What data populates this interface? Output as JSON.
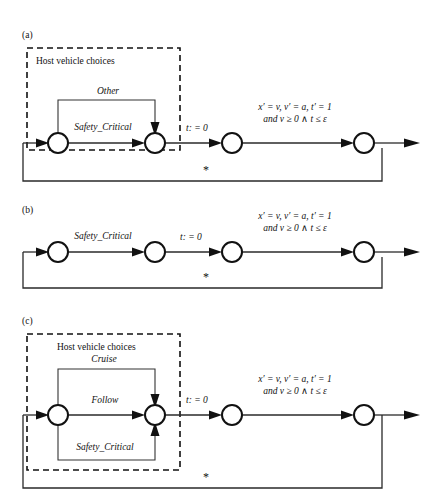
{
  "figure": {
    "type": "diagram",
    "panels": [
      {
        "id": "a",
        "label": "(a)",
        "box": {
          "present": true,
          "title": "Host vehicle choices",
          "style": "dashed"
        },
        "choice_transitions": [
          {
            "name": "Other",
            "route": "top-arc"
          },
          {
            "name": "Safety_Critical",
            "route": "straight"
          }
        ],
        "reset_label": "t: = 0",
        "flow_line1": "x′ = v, v′ = a, t′ = 1",
        "flow_line2": "and v ≥ 0 ∧ t ≤ ε",
        "loop_label": "*",
        "node_count": 4
      },
      {
        "id": "b",
        "label": "(b)",
        "box": {
          "present": false,
          "title": "",
          "style": "none"
        },
        "choice_transitions": [
          {
            "name": "Safety_Critical",
            "route": "straight"
          }
        ],
        "reset_label": "t: = 0",
        "flow_line1": "x′ = v, v′ = a, t′ = 1",
        "flow_line2": "and v ≥ 0 ∧ t ≤ ε",
        "loop_label": "*",
        "node_count": 4
      },
      {
        "id": "c",
        "label": "(c)",
        "box": {
          "present": true,
          "title": "Host vehicle choices",
          "style": "dashed"
        },
        "choice_transitions": [
          {
            "name": "Cruise",
            "route": "top-arc"
          },
          {
            "name": "Follow",
            "route": "straight"
          },
          {
            "name": "Safety_Critical",
            "route": "bottom-arc"
          }
        ],
        "reset_label": "t: = 0",
        "flow_line1": "x′ = v, v′ = a, t′ = 1",
        "flow_line2": "and v ≥ 0 ∧ t ≤ ε",
        "loop_label": "*",
        "node_count": 4
      }
    ],
    "colors": {
      "ink": "#111111",
      "edge": "#2a2a2a",
      "background": "#ffffff"
    }
  }
}
